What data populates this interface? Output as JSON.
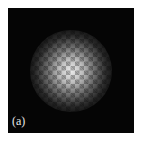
{
  "figure": {
    "panel_label": "(a)",
    "colors": {
      "background": "#050505",
      "spot_peak": "#ebebeb",
      "page": "#ffffff"
    }
  }
}
